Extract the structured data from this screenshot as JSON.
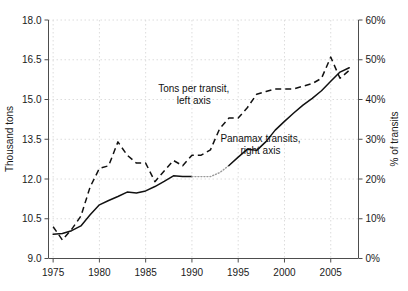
{
  "chart_data": {
    "type": "line",
    "title": "",
    "xlabel": "",
    "ylabel": "Thousand tons",
    "y2label": "% of transits",
    "xlim": [
      1974.5,
      2008.0
    ],
    "ylim": [
      9.0,
      18.0
    ],
    "y2lim": [
      0,
      60
    ],
    "grid": true,
    "legend": "inline-annotations",
    "x_ticks": [
      "1975",
      "1980",
      "1985",
      "1990",
      "1995",
      "2000",
      "2005"
    ],
    "x_tick_values": [
      1975,
      1980,
      1985,
      1990,
      1995,
      2000,
      2005
    ],
    "y_ticks": [
      "9.0",
      "10.5",
      "12.0",
      "13.5",
      "15.0",
      "16.5",
      "18.0"
    ],
    "y_tick_values": [
      9.0,
      10.5,
      12.0,
      13.5,
      15.0,
      16.5,
      18.0
    ],
    "y2_ticks": [
      "0%",
      "10%",
      "20%",
      "30%",
      "40%",
      "50%",
      "60%"
    ],
    "y2_tick_values": [
      0,
      10,
      20,
      30,
      40,
      50,
      60
    ],
    "x": [
      1975,
      1976,
      1977,
      1978,
      1979,
      1980,
      1981,
      1982,
      1983,
      1984,
      1985,
      1986,
      1987,
      1988,
      1989,
      1990,
      1991,
      1992,
      1993,
      1994,
      1995,
      1996,
      1997,
      1998,
      1999,
      2000,
      2001,
      2002,
      2003,
      2004,
      2005,
      2006,
      2007
    ],
    "series": [
      {
        "name": "Tons per transit, left axis",
        "style": "dashed",
        "axis": "left",
        "units": "Thousand tons",
        "values": [
          10.2,
          9.7,
          10.1,
          10.6,
          11.7,
          12.4,
          12.5,
          13.4,
          12.9,
          12.6,
          12.6,
          11.9,
          12.3,
          12.7,
          12.5,
          12.9,
          12.9,
          13.1,
          13.9,
          14.3,
          14.3,
          14.7,
          15.2,
          15.3,
          15.4,
          15.4,
          15.4,
          15.5,
          15.6,
          15.8,
          16.6,
          15.8,
          16.1
        ]
      },
      {
        "name": "Panamax transits, right axis",
        "style": "solid",
        "axis": "right",
        "units": "% of transits",
        "values": [
          6.1,
          6.3,
          7.0,
          8.2,
          11.0,
          13.5,
          14.6,
          15.6,
          16.7,
          16.5,
          17.0,
          18.1,
          19.4,
          20.8,
          20.6,
          20.6,
          20.6,
          20.6,
          21.6,
          23.4,
          25.5,
          27.5,
          27.2,
          29.4,
          32.3,
          34.5,
          36.6,
          38.6,
          40.3,
          42.2,
          44.6,
          46.9,
          48.0
        ],
        "interpolated_range": [
          1990,
          1994
        ]
      }
    ],
    "annotations": [
      {
        "text_line1": "Tons per transit,",
        "text_line2": "left axis",
        "x": 1990.2,
        "y": 15.3
      },
      {
        "text_line1": "Panamax transits,",
        "text_line2": "right axis",
        "x": 1997.4,
        "y": 13.4
      }
    ]
  },
  "axes": {
    "left_title": "Thousand tons",
    "right_title": "% of transits"
  },
  "colors": {
    "background": "#ffffff",
    "axis": "#4d4d4d",
    "gridline": "#dcdcdc",
    "series_line": "#111111",
    "interpolated": "#9a9a9a",
    "text": "#1a1a1a"
  }
}
